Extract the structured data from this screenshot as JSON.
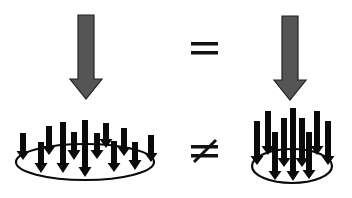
{
  "diagram": {
    "colors": {
      "big_arrow_fill": "#555555",
      "big_arrow_stroke": "#222222",
      "small_arrow_fill": "#0a0a0a",
      "ellipse_stroke": "#0a0a0a",
      "symbol": "#111111",
      "background": "#ffffff"
    },
    "top_row": {
      "left_arrow": {
        "icon": "down-arrow-icon",
        "label": "total force (left)"
      },
      "relation_symbol": "=",
      "right_arrow": {
        "icon": "down-arrow-icon",
        "label": "total force (right)"
      }
    },
    "bottom_row": {
      "left_group": {
        "arrow_count": 12,
        "area": "wide",
        "icon": "distributed-load-icon"
      },
      "relation_symbol": "≠",
      "right_group": {
        "arrow_count": 9,
        "area": "narrow",
        "icon": "concentrated-load-icon"
      }
    }
  }
}
